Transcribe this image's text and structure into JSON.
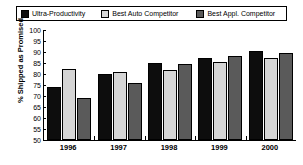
{
  "chart_data": {
    "type": "bar",
    "title": "",
    "xlabel": "",
    "ylabel": "% Shipped as Promised",
    "ylim": [
      50,
      100
    ],
    "ytick_step": 5,
    "yticks": [
      "100",
      "95",
      "90",
      "85",
      "80",
      "75",
      "70",
      "65",
      "60",
      "55",
      "50"
    ],
    "grid": false,
    "legend_position": "top",
    "categories": [
      "1996",
      "1997",
      "1998",
      "1999",
      "2000"
    ],
    "series": [
      {
        "name": "Ultra-Productivity",
        "color": "#0d0d0d",
        "values": [
          74,
          80,
          85,
          87.5,
          90.5
        ]
      },
      {
        "name": "Best Auto Competitor",
        "color": "#d5d5d5",
        "values": [
          82.5,
          81,
          82,
          85.5,
          87.5
        ]
      },
      {
        "name": "Best Appl. Competitor",
        "color": "#5a5a5a",
        "values": [
          69,
          76,
          84.5,
          88,
          89.5
        ]
      }
    ]
  },
  "legend": {
    "items": [
      {
        "label": "Ultra-Productivity",
        "swatch": "#0d0d0d"
      },
      {
        "label": "Best Auto Competitor",
        "swatch": "#d5d5d5"
      },
      {
        "label": "Best Appl. Competitor",
        "swatch": "#5a5a5a"
      }
    ]
  }
}
